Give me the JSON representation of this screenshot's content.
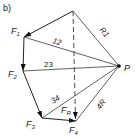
{
  "figure": {
    "panel_label": "b)",
    "pole_label": "P",
    "forces": [
      {
        "label": "F",
        "sub": "1"
      },
      {
        "label": "F",
        "sub": "2"
      },
      {
        "label": "F",
        "sub": "3"
      },
      {
        "label": "F",
        "sub": "4"
      }
    ],
    "resultant": {
      "label": "F",
      "sub": "R"
    },
    "rays": [
      {
        "label": "R1"
      },
      {
        "label": "12"
      },
      {
        "label": "23"
      },
      {
        "label": "34"
      },
      {
        "label": "4R"
      }
    ],
    "colors": {
      "line": "#3a3a3a",
      "text": "#1a1a1a",
      "background": "#ffffff"
    }
  }
}
